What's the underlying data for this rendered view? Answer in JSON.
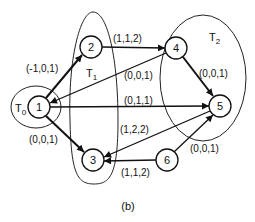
{
  "caption": "(b)",
  "sets": [
    {
      "id": "T0",
      "label": "T",
      "sub": "0"
    },
    {
      "id": "T1",
      "label": "T",
      "sub": "1"
    },
    {
      "id": "T2",
      "label": "T",
      "sub": "2"
    }
  ],
  "nodes": [
    {
      "id": "1",
      "label": "1"
    },
    {
      "id": "2",
      "label": "2"
    },
    {
      "id": "3",
      "label": "3"
    },
    {
      "id": "4",
      "label": "4"
    },
    {
      "id": "5",
      "label": "5"
    },
    {
      "id": "6",
      "label": "6"
    }
  ],
  "edges": [
    {
      "from": "1",
      "to": "2",
      "label": "(-1,0,1)"
    },
    {
      "from": "2",
      "to": "4",
      "label": "(1,1,2)"
    },
    {
      "from": "4",
      "to": "1",
      "label": "(0,0,1)"
    },
    {
      "from": "4",
      "to": "5",
      "label": "(0,0,1)"
    },
    {
      "from": "1",
      "to": "5",
      "label": "(0,1,1)"
    },
    {
      "from": "1",
      "to": "3",
      "label": "(0,0,1)"
    },
    {
      "from": "5",
      "to": "3",
      "label": "(1,2,2)"
    },
    {
      "from": "6",
      "to": "3",
      "label": "(1,1,2)"
    },
    {
      "from": "6",
      "to": "5",
      "label": "(0,0,1)"
    }
  ]
}
